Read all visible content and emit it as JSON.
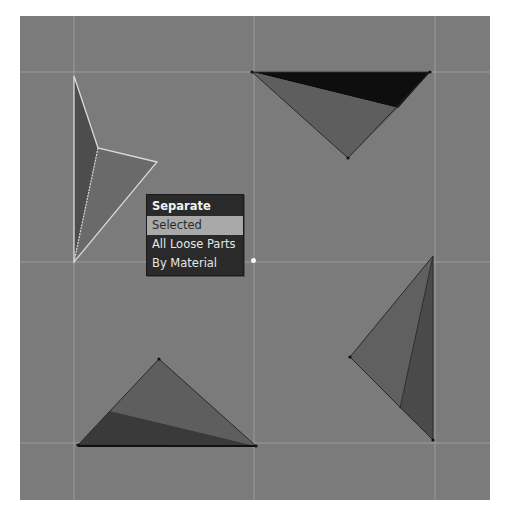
{
  "viewport": {
    "background": "#7b7b7b",
    "grid_color": "#9c9c9c",
    "grid_lines": {
      "vertical_x": [
        74,
        254,
        435
      ],
      "horizontal_y": [
        72,
        262,
        443
      ]
    }
  },
  "objects": [
    {
      "name": "triangle-top-left",
      "selected": true,
      "faces": [
        {
          "points": "74,76 98,148 74,262",
          "fill": "#4d4d4d"
        },
        {
          "points": "98,148 157,162 74,262",
          "fill": "#6a6a6a"
        }
      ],
      "edge_color": "#d8d8d8"
    },
    {
      "name": "triangle-top-right",
      "selected": false,
      "faces": [
        {
          "points": "252,72 430,72 398,108",
          "fill": "#0e0e0e"
        },
        {
          "points": "252,72 398,108 348,158",
          "fill": "#5e5e5e"
        }
      ],
      "edge_color": "#2a2a2a"
    },
    {
      "name": "triangle-bottom-right",
      "selected": false,
      "faces": [
        {
          "points": "433,256 350,357 400,408",
          "fill": "#606060"
        },
        {
          "points": "433,256 400,408 433,440",
          "fill": "#4a4a4a"
        }
      ],
      "edge_color": "#2a2a2a"
    },
    {
      "name": "triangle-bottom-left",
      "selected": false,
      "faces": [
        {
          "points": "159,359 110,411 256,446",
          "fill": "#5e5e5e"
        },
        {
          "points": "110,411 78,445 256,446",
          "fill": "#3a3a3a"
        }
      ],
      "edge_color": "#2a2a2a"
    }
  ],
  "menu": {
    "title": "Separate",
    "items": [
      {
        "label": "Selected",
        "active": true
      },
      {
        "label": "All Loose Parts",
        "active": false
      },
      {
        "label": "By Material",
        "active": false
      }
    ]
  }
}
